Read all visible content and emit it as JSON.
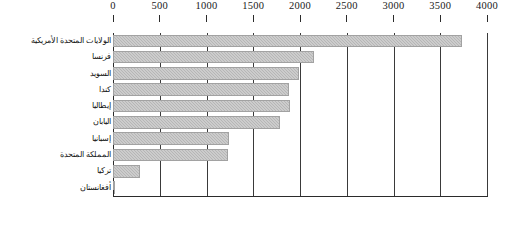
{
  "chart_data": {
    "type": "bar",
    "orientation": "horizontal",
    "title": "",
    "subtitle": "",
    "xlabel": "",
    "ylabel": "",
    "xlim": [
      0,
      4000
    ],
    "xticks": [
      0,
      500,
      1000,
      1500,
      2000,
      2500,
      3000,
      3500,
      4000
    ],
    "xtick_labels": [
      "0",
      "500",
      "1000",
      "1500",
      "2000",
      "2500",
      "3000",
      "3500",
      "4000"
    ],
    "grid": true,
    "grid_axis": "x",
    "legend": false,
    "legend_position": "none",
    "axis_position": "top",
    "language": "ar",
    "direction": "rtl",
    "bar_color": "#b6b6b6",
    "bar_edge_color": "#a2a2a2",
    "axis_color": "#2b2b2b",
    "background_color": "#ffffff",
    "categories": [
      "الولايات المتحدة الأمريكية",
      "فرنسا",
      "السويد",
      "كندا",
      "إيطاليا",
      "اليابان",
      "إسبانيا",
      "المملكة المتحدة",
      "تركيا",
      "أفغانستان"
    ],
    "values": [
      3730,
      2150,
      1990,
      1880,
      1890,
      1790,
      1240,
      1230,
      290,
      20
    ]
  }
}
